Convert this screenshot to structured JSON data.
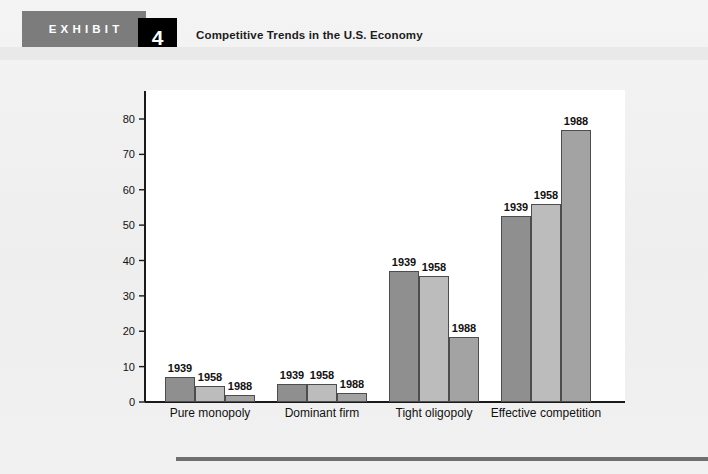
{
  "header": {
    "exhibit_word": "EXHIBIT",
    "exhibit_number": "4",
    "title": "Competitive Trends in the U.S. Economy",
    "band_color": "#7c7c7c",
    "number_box_color": "#000000"
  },
  "chart_data": {
    "type": "bar",
    "title": "Competitive Trends in the U.S. Economy",
    "xlabel": "",
    "ylabel": "Percentage share of each group",
    "ylim": [
      0,
      80
    ],
    "yticks": [
      0,
      10,
      20,
      30,
      40,
      50,
      60,
      70,
      80
    ],
    "grid": false,
    "legend": "none",
    "bar_value_labels": "year shown above each bar",
    "categories": [
      "Pure monopoly",
      "Dominant firm",
      "Tight oligopoly",
      "Effective competition"
    ],
    "series": [
      {
        "name": "1939",
        "color": "#8f8f8f",
        "values": [
          7,
          5,
          37,
          52.5
        ]
      },
      {
        "name": "1958",
        "color": "#bcbcbc",
        "values": [
          4.5,
          5,
          35.5,
          56
        ]
      },
      {
        "name": "1988",
        "color": "#a3a3a3",
        "values": [
          2,
          2.5,
          18.5,
          77
        ]
      }
    ]
  },
  "footer": {
    "rule_color": "#6f6f6f"
  }
}
